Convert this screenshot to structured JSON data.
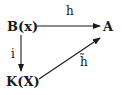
{
  "diagram": {
    "type": "commutative-diagram",
    "nodes": {
      "b": {
        "label": "B(x)"
      },
      "a": {
        "label": "A"
      },
      "k": {
        "label": "K(X)"
      }
    },
    "edges": [
      {
        "from": "b",
        "to": "a",
        "label": "h"
      },
      {
        "from": "b",
        "to": "k",
        "label": "i"
      },
      {
        "from": "k",
        "to": "a",
        "label": "h̃"
      }
    ],
    "colors": {
      "stroke": "#1a1a1a",
      "background": "#ffffff"
    }
  }
}
